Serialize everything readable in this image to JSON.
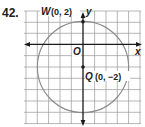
{
  "problem": {
    "number": "42."
  },
  "graph": {
    "axis_labels": {
      "x": "x",
      "y": "y",
      "origin": "O"
    },
    "points": [
      {
        "name": "W",
        "coords": "(0, 2)",
        "x": 0,
        "y": 2
      },
      {
        "name": "Q",
        "coords": "(0, −2)",
        "x": 0,
        "y": -2
      }
    ],
    "circle": {
      "center": "Q",
      "center_x": 0,
      "center_y": -2,
      "radius_units": 4
    },
    "grid": {
      "x_range": [
        -5,
        5
      ],
      "y_range": [
        -7,
        3
      ]
    },
    "colors": {
      "grid": "#9a9a9a",
      "circle": "#8a8a8a",
      "axis": "#1a1a1a",
      "text": "#222222"
    }
  }
}
